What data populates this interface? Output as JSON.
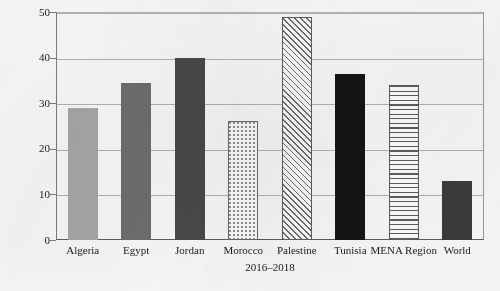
{
  "chart_data": {
    "type": "bar",
    "title": "",
    "xlabel": "2016–2018",
    "ylabel": "Youth Unemployment %",
    "categories": [
      "Algeria",
      "Egypt",
      "Jordan",
      "Morocco",
      "Palestine",
      "Tunisia",
      "MENA Region",
      "World"
    ],
    "values": [
      29.0,
      34.5,
      40.0,
      26.0,
      49.0,
      36.3,
      34.0,
      13.0
    ],
    "ylim": [
      0,
      50
    ],
    "yticks": [
      0,
      10,
      20,
      30,
      40,
      50
    ],
    "ytick_labels": [
      "0",
      "10",
      "20",
      "30",
      "40",
      "50"
    ],
    "grid": true,
    "legend": "none",
    "bar_styles": [
      "solid-light",
      "solid-mid",
      "solid-dark",
      "dotted",
      "diagonal",
      "solid-black",
      "horizontal",
      "solid-darker"
    ],
    "colors": {
      "solid-light": "#a8a8a8",
      "solid-mid": "#6f6f6f",
      "solid-dark": "#4a4a4a",
      "solid-black": "#151515",
      "solid-darker": "#3c3c3c",
      "pattern-outline": "#5e5e5e",
      "gridline": "#b3b3b3",
      "axis": "#5d5d5d",
      "background": "#fbfbfa",
      "text": "#1b1b1b"
    }
  }
}
